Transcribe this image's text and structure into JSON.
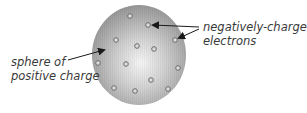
{
  "diagram": {
    "labels": {
      "sphere_line1": "sphere of",
      "sphere_line2": "positive charge",
      "electrons_line1": "negatively-charged",
      "electrons_line2": "electrons"
    },
    "sphere": {
      "cx": 139,
      "cy": 55,
      "rx": 47,
      "ry": 50,
      "color_center": "#f4f4f4",
      "color_edge": "#9a9a9a"
    },
    "electrons": [
      {
        "x": 130,
        "y": 16
      },
      {
        "x": 148,
        "y": 25
      },
      {
        "x": 116,
        "y": 40
      },
      {
        "x": 137,
        "y": 46
      },
      {
        "x": 154,
        "y": 49
      },
      {
        "x": 175,
        "y": 40
      },
      {
        "x": 98,
        "y": 63
      },
      {
        "x": 126,
        "y": 64
      },
      {
        "x": 178,
        "y": 68
      },
      {
        "x": 151,
        "y": 80
      },
      {
        "x": 114,
        "y": 88
      },
      {
        "x": 135,
        "y": 91
      },
      {
        "x": 168,
        "y": 89
      }
    ]
  }
}
